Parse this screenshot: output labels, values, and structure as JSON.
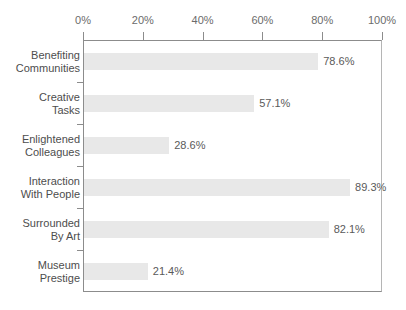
{
  "chart_data": {
    "type": "bar",
    "orientation": "horizontal",
    "title": "",
    "subtitle": "",
    "xlabel": "",
    "ylabel": "",
    "xlim": [
      0,
      100
    ],
    "grid": false,
    "legend": null,
    "x_tick_labels": [
      "0%",
      "20%",
      "40%",
      "60%",
      "80%",
      "100%"
    ],
    "x_tick_values": [
      0,
      20,
      40,
      60,
      80,
      100
    ],
    "categories": [
      "Benefiting Communities",
      "Creative Tasks",
      "Enlightened Colleagues",
      "Interaction With People",
      "Surrounded By Art",
      "Museum Prestige"
    ],
    "category_lines": [
      [
        "Benefiting",
        "Communities"
      ],
      [
        "Creative",
        "Tasks"
      ],
      [
        "Enlightened",
        "Colleagues"
      ],
      [
        "Interaction",
        "With People"
      ],
      [
        "Surrounded",
        "By Art"
      ],
      [
        "Museum",
        "Prestige"
      ]
    ],
    "values": [
      78.6,
      57.1,
      28.6,
      89.3,
      82.1,
      21.4
    ],
    "value_labels": [
      "78.6%",
      "57.1%",
      "28.6%",
      "89.3%",
      "82.1%",
      "21.4%"
    ],
    "bar_color": "#e8e8e8",
    "axis_color": "#8c8c8c",
    "tick_text_color": "#6b6b6b",
    "category_text_color": "#4d4d4d",
    "value_text_color": "#5a5a5a",
    "background_color": "#ffffff"
  }
}
